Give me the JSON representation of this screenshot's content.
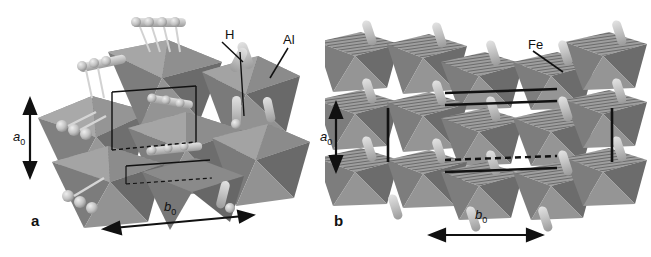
{
  "figure": {
    "type": "crystal-structure-polyhedral-model",
    "background_color": "#ffffff",
    "panels": [
      {
        "id": "a",
        "letter": "a",
        "view": "tilted perspective",
        "polyhedra_label": "Al",
        "polyhedra_element": "Al",
        "atom_label": "H",
        "atom_element": "H",
        "polyhedron_type": "octahedron",
        "axes": [
          {
            "name": "a0",
            "label": "a",
            "subscript": "0",
            "orientation": "vertical"
          },
          {
            "name": "b0",
            "label": "b",
            "subscript": "0",
            "orientation": "horizontal"
          }
        ],
        "colors": {
          "polyhedron_light": "#b4b4b4",
          "polyhedron_mid": "#8c8c8c",
          "polyhedron_dark": "#6e6e6e",
          "atom": "#c8c8c8",
          "cell_line": "#111111"
        }
      },
      {
        "id": "b",
        "letter": "b",
        "view": "edge-on projection",
        "polyhedra_label": "Fe",
        "polyhedra_element": "Fe",
        "polyhedron_type": "octahedron",
        "axes": [
          {
            "name": "a0",
            "label": "a",
            "subscript": "0",
            "orientation": "vertical"
          },
          {
            "name": "b0",
            "label": "b",
            "subscript": "0",
            "orientation": "horizontal"
          }
        ],
        "colors": {
          "polyhedron_light": "#b4b4b4",
          "polyhedron_mid": "#8c8c8c",
          "polyhedron_dark": "#6e6e6e",
          "atom": "#c8c8c8",
          "cell_line": "#111111"
        }
      }
    ]
  },
  "labels": {
    "panel_a_letter": "a",
    "panel_b_letter": "b",
    "hydrogen": "H",
    "aluminium": "Al",
    "iron": "Fe",
    "a_axis": "a",
    "a_axis_sub": "0",
    "b_axis": "b",
    "b_axis_sub": "0"
  }
}
